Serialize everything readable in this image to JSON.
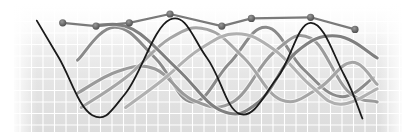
{
  "chart_data": {
    "type": "line",
    "title": "",
    "xlabel": "",
    "ylabel": "",
    "grid": true,
    "legend": "none",
    "xlim": [
      0,
      10
    ],
    "ylim": [
      0,
      10
    ],
    "series": [
      {
        "name": "marker-line",
        "style": "markers",
        "color": "#7a7a7a",
        "x": [
          1.1,
          2.0,
          2.9,
          4.0,
          5.4,
          6.2,
          7.8,
          9.0
        ],
        "y": [
          9.2,
          8.9,
          9.2,
          10.0,
          8.9,
          9.6,
          9.7,
          8.6
        ]
      },
      {
        "name": "black-wave",
        "style": "line",
        "color": "#1a1a1a",
        "x": [
          0.4,
          1.0,
          1.9,
          2.8,
          4.0,
          5.0,
          5.9,
          6.9,
          7.8,
          8.7,
          9.2
        ],
        "y": [
          9.4,
          6.0,
          0.8,
          2.8,
          9.5,
          6.0,
          0.9,
          4.2,
          9.2,
          4.5,
          0.5
        ]
      },
      {
        "name": "gray-wave-1",
        "style": "line",
        "color": "#8a8a8a",
        "x": [
          1.5,
          2.5,
          3.6,
          4.6,
          5.6,
          6.6,
          7.6,
          8.6,
          9.5
        ],
        "y": [
          5.8,
          8.8,
          6.0,
          2.0,
          5.5,
          8.8,
          5.0,
          2.5,
          4.2
        ]
      },
      {
        "name": "gray-wave-2",
        "style": "line",
        "color": "#9a9a9a",
        "x": [
          1.5,
          2.6,
          3.6,
          4.6,
          5.7,
          6.8,
          7.8,
          8.8,
          9.6
        ],
        "y": [
          2.8,
          4.8,
          5.0,
          2.2,
          2.0,
          6.5,
          7.8,
          3.0,
          2.0
        ]
      },
      {
        "name": "gray-wave-3",
        "style": "line",
        "color": "#a5a5a5",
        "x": [
          1.6,
          2.8,
          4.0,
          5.0,
          6.0,
          7.0,
          8.0,
          8.9,
          9.6
        ],
        "y": [
          1.5,
          4.2,
          7.8,
          8.6,
          6.0,
          2.2,
          3.2,
          5.6,
          3.6
        ]
      },
      {
        "name": "gray-wave-4",
        "style": "line",
        "color": "#b0b0b0",
        "x": [
          2.8,
          3.8,
          4.8,
          5.8,
          6.8,
          7.8,
          8.6,
          9.6
        ],
        "y": [
          1.5,
          4.0,
          6.8,
          8.2,
          6.8,
          3.5,
          1.8,
          3.2
        ]
      },
      {
        "name": "gray-wave-5",
        "style": "line",
        "color": "#7f7f7f",
        "x": [
          2.0,
          3.0,
          4.2,
          5.4,
          6.4,
          7.4,
          8.5,
          9.6
        ],
        "y": [
          9.0,
          8.6,
          5.0,
          1.2,
          2.0,
          6.5,
          8.0,
          6.0
        ]
      }
    ]
  }
}
